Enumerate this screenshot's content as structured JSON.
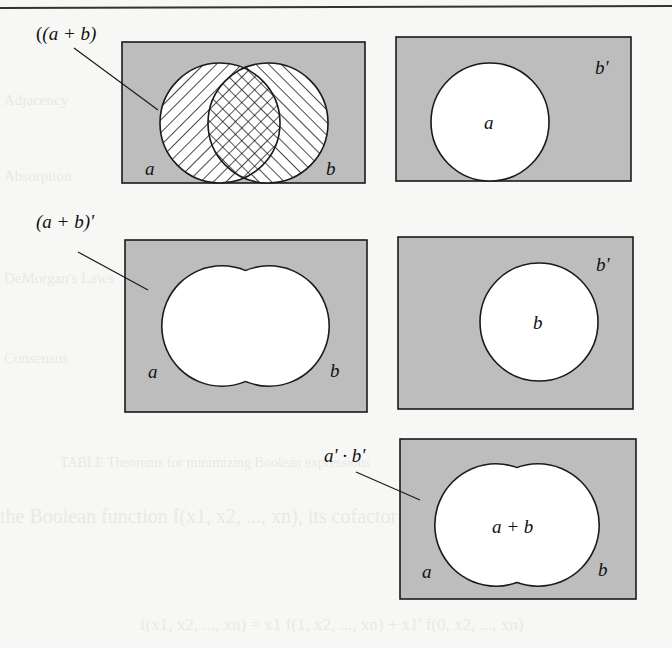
{
  "figure": {
    "colors": {
      "paper": "#f7f7f5",
      "shade": "#bdbdbd",
      "ink": "#1a1a1a",
      "region_white": "#ffffff"
    },
    "panels": [
      {
        "id": "panel-a-plus-b",
        "callout": "(a + b)",
        "labels": {
          "left": "a",
          "right": "b"
        },
        "description": "Two overlapping circles a and b, hatched in opposite directions; overlap cross-hatched"
      },
      {
        "id": "panel-b-complement-a",
        "corner_label": "b'",
        "center_label": "a",
        "description": "Single white circle a on shaded background"
      },
      {
        "id": "panel-a-plus-b-complement",
        "callout": "(a + b)'",
        "labels": {
          "left": "a",
          "right": "b"
        },
        "description": "Union of a and b left white; outside region shaded"
      },
      {
        "id": "panel-b-complement-b",
        "corner_label": "b'",
        "center_label": "b",
        "description": "Single white circle b on shaded background"
      },
      {
        "id": "panel-a-prime-b-prime",
        "callout": "a' · b'",
        "center_label": "a + b",
        "labels": {
          "left": "a",
          "right": "b"
        },
        "description": "Union a + b white; shaded region equals a' · b'"
      }
    ]
  },
  "bleed_through_text": [
    "Adjacency",
    "Absorption",
    "DeMorgan's Laws",
    "Consensus",
    "TABLE  Theorems for minimizing Boolean expressions",
    "the Boolean function f(x1, x2, ..., xn), its cofactor with respect",
    "f(x1, x2, ..., xn) = x1 f(1, x2, ..., xn) + x1' f(0, x2, ..., xn)"
  ]
}
